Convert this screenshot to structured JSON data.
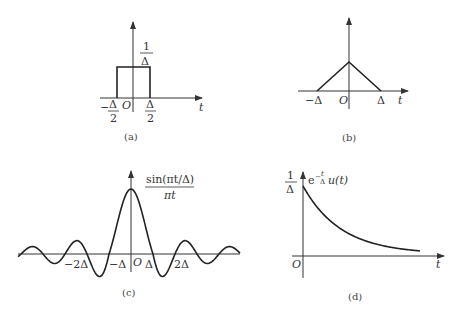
{
  "panels": {
    "a": {
      "caption": "(a)",
      "type": "rectangular pulse",
      "height_label_num": "1",
      "height_label_den": "Δ",
      "left_label_sign": "−",
      "left_label_num": "Δ",
      "left_label_den": "2",
      "right_label_num": "Δ",
      "right_label_den": "2",
      "origin": "O",
      "axis_label": "t"
    },
    "b": {
      "caption": "(b)",
      "type": "triangular pulse",
      "left_label": "−Δ",
      "right_label": "Δ",
      "origin": "O",
      "axis_label": "t"
    },
    "c": {
      "caption": "(c)",
      "type": "sinc",
      "func_num": "sin(πt/Δ)",
      "func_den": "πt",
      "tick_labels": [
        "−2Δ",
        "−Δ",
        "O",
        "Δ",
        "2Δ"
      ]
    },
    "d": {
      "caption": "(d)",
      "type": "decaying exponential",
      "height_label_num": "1",
      "height_label_den": "Δ",
      "func_prefix": "e",
      "func_exp_sign": "−",
      "func_exp_num": "t",
      "func_exp_den": "Δ",
      "func_suffix": "u(t)",
      "origin": "O",
      "axis_label": "t"
    }
  },
  "chart_data": [
    {
      "type": "line",
      "title": "(a) Rectangular pulse",
      "x": [
        -0.5,
        -0.5,
        0.5,
        0.5
      ],
      "y": [
        0,
        1,
        1,
        0
      ],
      "xlabel": "t",
      "ylabel": "",
      "notes": "height 1/Δ, width Δ from −Δ/2 to Δ/2"
    },
    {
      "type": "line",
      "title": "(b) Triangular pulse",
      "x": [
        -1,
        0,
        1
      ],
      "y": [
        0,
        1,
        0
      ],
      "xlabel": "t",
      "notes": "base from −Δ to Δ"
    },
    {
      "type": "line",
      "title": "(c) sin(πt/Δ)/(πt)",
      "xlabel": "t",
      "notes": "zeros at ±Δ, ±2Δ, ...; peak 1/Δ at t=0"
    },
    {
      "type": "line",
      "title": "(d) (1/Δ) e^(−t/Δ) u(t)",
      "xlabel": "t",
      "notes": "starts at 1/Δ at t=0 and decays to 0"
    }
  ]
}
